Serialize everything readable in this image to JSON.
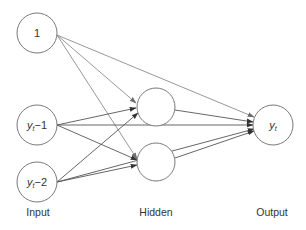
{
  "diagram": {
    "type": "neural-network",
    "layers": {
      "input": {
        "label": "Input",
        "nodes": [
          {
            "id": "bias",
            "label": "1"
          },
          {
            "id": "y_lag1",
            "label_main": "y",
            "label_sub": "t",
            "label_tail": "−1"
          },
          {
            "id": "y_lag2",
            "label_main": "y",
            "label_sub": "t",
            "label_tail": "−2"
          }
        ]
      },
      "hidden": {
        "label": "Hidden",
        "nodes": [
          {
            "id": "h1",
            "label": ""
          },
          {
            "id": "h2",
            "label": ""
          }
        ]
      },
      "output": {
        "label": "Output",
        "nodes": [
          {
            "id": "out",
            "label_main": "y",
            "label_sub": "t"
          }
        ]
      }
    },
    "edges": [
      {
        "from": "bias",
        "to": "h1"
      },
      {
        "from": "bias",
        "to": "h2"
      },
      {
        "from": "bias",
        "to": "out"
      },
      {
        "from": "y_lag1",
        "to": "h1"
      },
      {
        "from": "y_lag1",
        "to": "h2"
      },
      {
        "from": "y_lag1",
        "to": "out"
      },
      {
        "from": "y_lag2",
        "to": "h1"
      },
      {
        "from": "y_lag2",
        "to": "h2"
      },
      {
        "from": "y_lag2",
        "to": "out"
      },
      {
        "from": "h1",
        "to": "out"
      },
      {
        "from": "h2",
        "to": "out"
      }
    ],
    "colors": {
      "node_stroke": "#7a7a7a",
      "edge": "#555555",
      "edge_bias": "#8c8c8c",
      "text": "#333333"
    }
  }
}
